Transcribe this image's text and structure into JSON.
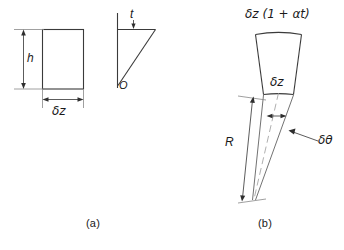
{
  "figure": {
    "title_visible": false,
    "background_color": "#ffffff",
    "line_color": "#3a3a3a",
    "text_color": "#1a1a1a",
    "panels": [
      {
        "id": "a",
        "caption": "(a)",
        "labels": {
          "height": "h",
          "width": "δz",
          "thickness": "t",
          "origin": "O"
        }
      },
      {
        "id": "b",
        "caption": "(b)",
        "labels": {
          "outer_arc": "δz (1 + αt)",
          "inner_arc": "δz",
          "radius": "R",
          "angle": "δθ"
        }
      }
    ]
  },
  "panel_a": {
    "caption": "(a)",
    "rect_label_height": "h",
    "rect_label_width": "δz",
    "triangle_label_thickness": "t",
    "triangle_label_origin": "O"
  },
  "panel_b": {
    "caption": "(b)",
    "label_outer": "δz (1 + αt)",
    "label_inner": "δz",
    "label_radius": "R",
    "label_angle": "δθ"
  }
}
